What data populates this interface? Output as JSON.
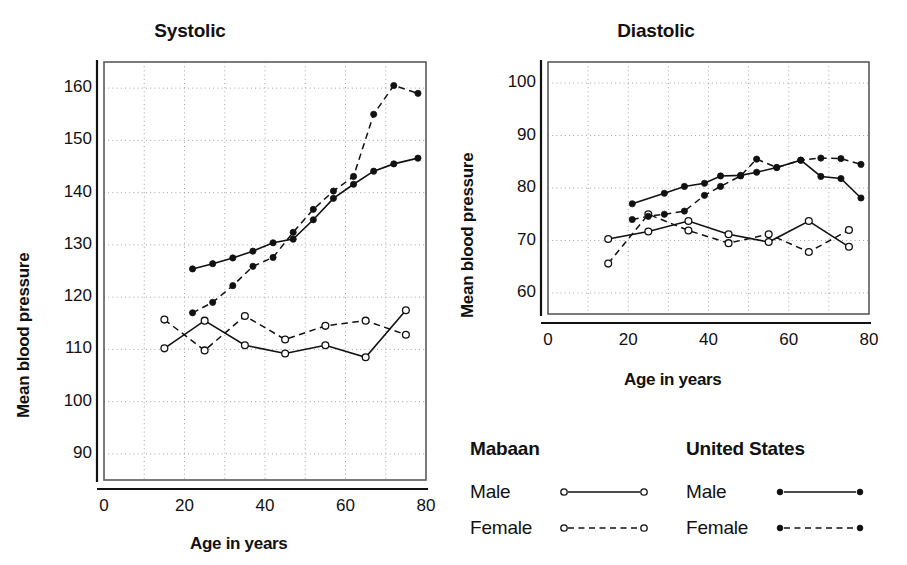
{
  "figure": {
    "background": "#ffffff",
    "ink": "#111111"
  },
  "panels": {
    "systolic": {
      "title": "Systolic",
      "ylabel": "Mean blood pressure",
      "xlabel": "Age in years",
      "yticks": [
        "90",
        "100",
        "110",
        "120",
        "130",
        "140",
        "150",
        "160"
      ],
      "xticks": [
        "0",
        "20",
        "40",
        "60",
        "80"
      ]
    },
    "diastolic": {
      "title": "Diastolic",
      "ylabel": "Mean blood pressure",
      "xlabel": "Age in years",
      "yticks": [
        "60",
        "70",
        "80",
        "90",
        "100"
      ],
      "xticks": [
        "0",
        "20",
        "40",
        "60",
        "80"
      ]
    }
  },
  "legend": {
    "groups": [
      {
        "heading": "Mabaan",
        "marker": "open-circle",
        "rows": [
          {
            "label": "Male",
            "line": "solid",
            "marker": "open-circle"
          },
          {
            "label": "Female",
            "line": "dashed",
            "marker": "open-circle"
          }
        ]
      },
      {
        "heading": "United States",
        "marker": "filled-circle",
        "rows": [
          {
            "label": "Male",
            "line": "solid",
            "marker": "filled-circle"
          },
          {
            "label": "Female",
            "line": "dashed",
            "marker": "filled-circle"
          }
        ]
      }
    ]
  },
  "chart_data": [
    {
      "id": "systolic",
      "type": "line",
      "title": "Systolic",
      "xlabel": "Age in years",
      "ylabel": "Mean blood pressure",
      "xlim": [
        0,
        80
      ],
      "ylim": [
        85,
        165
      ],
      "xticks": [
        0,
        20,
        40,
        60,
        80
      ],
      "yticks": [
        90,
        100,
        110,
        120,
        130,
        140,
        150,
        160
      ],
      "grid": true,
      "gridlines_x": [
        10,
        20,
        30,
        40,
        50,
        60,
        70
      ],
      "gridlines_y": [
        90,
        100,
        110,
        120,
        130,
        140,
        150,
        160
      ],
      "legend_position": "below-right",
      "series": [
        {
          "name": "Mabaan Male",
          "population": "Mabaan",
          "sex": "Male",
          "line": "solid",
          "marker": "open-circle",
          "x": [
            15,
            25,
            35,
            45,
            55,
            65,
            75
          ],
          "y": [
            110.2,
            115.5,
            110.8,
            109.2,
            110.8,
            108.5,
            117.5
          ]
        },
        {
          "name": "Mabaan Female",
          "population": "Mabaan",
          "sex": "Female",
          "line": "dashed",
          "marker": "open-circle",
          "x": [
            15,
            25,
            35,
            45,
            55,
            65,
            75
          ],
          "y": [
            115.7,
            109.8,
            116.4,
            111.9,
            114.5,
            115.5,
            112.8
          ]
        },
        {
          "name": "United States Male",
          "population": "United States",
          "sex": "Male",
          "line": "solid",
          "marker": "filled-circle",
          "x": [
            22,
            27,
            32,
            37,
            42,
            47,
            52,
            57,
            62,
            67,
            72,
            78
          ],
          "y": [
            125.4,
            126.4,
            127.5,
            128.8,
            130.4,
            131.1,
            134.8,
            138.9,
            141.6,
            144.1,
            145.5,
            146.6
          ]
        },
        {
          "name": "United States Female",
          "population": "United States",
          "sex": "Female",
          "line": "dashed",
          "marker": "filled-circle",
          "x": [
            22,
            27,
            32,
            37,
            42,
            47,
            52,
            57,
            62,
            67,
            72,
            78
          ],
          "y": [
            117.0,
            119.0,
            122.2,
            125.9,
            127.6,
            132.4,
            136.8,
            140.3,
            143.1,
            155.0,
            160.5,
            159.0
          ]
        }
      ]
    },
    {
      "id": "diastolic",
      "type": "line",
      "title": "Diastolic",
      "xlabel": "Age in years",
      "ylabel": "Mean blood pressure",
      "xlim": [
        0,
        80
      ],
      "ylim": [
        56,
        104
      ],
      "xticks": [
        0,
        20,
        40,
        60,
        80
      ],
      "yticks": [
        60,
        70,
        80,
        90,
        100
      ],
      "grid": true,
      "gridlines_x": [
        10,
        20,
        30,
        40,
        50,
        60,
        70
      ],
      "gridlines_y": [
        60,
        70,
        80,
        90,
        100
      ],
      "legend_position": "below-left",
      "series": [
        {
          "name": "Mabaan Male",
          "population": "Mabaan",
          "sex": "Male",
          "line": "solid",
          "marker": "open-circle",
          "x": [
            15,
            25,
            35,
            45,
            55,
            65,
            75
          ],
          "y": [
            70.3,
            71.7,
            73.7,
            71.2,
            69.7,
            73.7,
            68.8
          ]
        },
        {
          "name": "Mabaan Female",
          "population": "Mabaan",
          "sex": "Female",
          "line": "dashed",
          "marker": "open-circle",
          "x": [
            15,
            25,
            35,
            45,
            55,
            65,
            75
          ],
          "y": [
            65.6,
            75.0,
            71.9,
            69.5,
            71.2,
            67.8,
            72.0
          ]
        },
        {
          "name": "United States Male",
          "population": "United States",
          "sex": "Male",
          "line": "solid",
          "marker": "filled-circle",
          "x": [
            21,
            29,
            34,
            39,
            43,
            48,
            52,
            57,
            63,
            68,
            73,
            78
          ],
          "y": [
            77.0,
            79.0,
            80.3,
            80.9,
            82.3,
            82.4,
            83.0,
            83.9,
            85.3,
            82.2,
            81.8,
            78.1
          ]
        },
        {
          "name": "United States Female",
          "population": "United States",
          "sex": "Female",
          "line": "dashed",
          "marker": "filled-circle",
          "x": [
            21,
            25,
            29,
            34,
            39,
            43,
            48,
            52,
            57,
            63,
            68,
            73,
            78
          ],
          "y": [
            74.0,
            74.6,
            75.0,
            75.6,
            78.6,
            80.3,
            82.3,
            85.5,
            83.9,
            85.3,
            85.7,
            85.6,
            84.5
          ]
        }
      ]
    }
  ]
}
